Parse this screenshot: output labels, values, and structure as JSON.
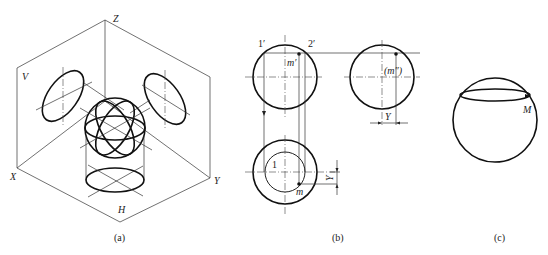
{
  "figure_a": {
    "caption": "(a)",
    "axis_labels": {
      "z": "Z",
      "x": "X",
      "y": "Y"
    },
    "plane_labels": {
      "v": "V",
      "h": "H"
    }
  },
  "figure_b": {
    "caption": "(b)",
    "point_labels": {
      "one_prime": "1′",
      "two_prime": "2′",
      "m_prime": "m′",
      "m_double_prime": "(m″)",
      "one": "1",
      "m": "m"
    },
    "dimension_labels": {
      "y_side": "Y",
      "y_top": "Y"
    }
  },
  "figure_c": {
    "caption": "(c)",
    "point_labels": {
      "M": "M"
    }
  }
}
